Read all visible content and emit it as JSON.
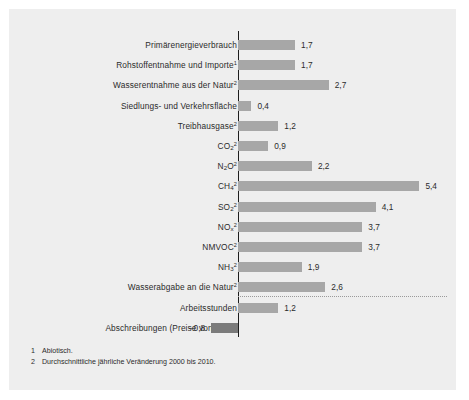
{
  "chart_data": {
    "type": "bar",
    "orientation": "horizontal",
    "title": "",
    "xlabel": "",
    "ylabel": "",
    "grid": false,
    "legend": null,
    "axis_zero": 0,
    "xlim": [
      -1.0,
      6.0
    ],
    "value_decimal_separator": ",",
    "categories": [
      "Primärenergieverbrauch",
      "Rohstoffentnahme und Importe",
      "Wasserentnahme aus der Natur",
      "Siedlungs- und Verkehrsfläche",
      "Treibhausgase",
      "CO2",
      "N2O",
      "CH4",
      "SO2",
      "NOx",
      "NMVOC",
      "NH3",
      "Wasserabgabe an die Natur",
      "Arbeitsstunden",
      "Abschreibungen (Preise von 2000)"
    ],
    "values": [
      1.7,
      1.7,
      2.7,
      0.4,
      1.2,
      0.9,
      2.2,
      5.4,
      4.1,
      3.7,
      3.7,
      1.9,
      2.6,
      1.2,
      -0.8
    ],
    "value_labels": [
      "1,7",
      "1,7",
      "2,7",
      "0,4",
      "1,2",
      "0,9",
      "2,2",
      "5,4",
      "4,1",
      "3,7",
      "3,7",
      "1,9",
      "2,6",
      "1,2",
      "−0,8"
    ]
  },
  "panel": {
    "background_color": "#eeeeee",
    "bar_color_positive": "#a7a7a7",
    "bar_color_negative": "#7b7b7b",
    "axis_color": "#1d1d1d",
    "separator_color": "#9a9a9a"
  },
  "rows": [
    {
      "label_html": "Primärenergieverbrauch",
      "label_main": "Primärenergieverbrauch",
      "label_sub": "",
      "label_sup": "",
      "value": 1.7,
      "value_label": "1,7"
    },
    {
      "label_html": "Rohstoffentnahme und Importe¹",
      "label_main": "Rohstoffentnahme und Importe",
      "label_sub": "",
      "label_sup": "1",
      "value": 1.7,
      "value_label": "1,7"
    },
    {
      "label_html": "Wasserentnahme aus der Natur²",
      "label_main": "Wasserentnahme aus der Natur",
      "label_sub": "",
      "label_sup": "2",
      "value": 2.7,
      "value_label": "2,7"
    },
    {
      "label_html": "Siedlungs- und Verkehrsfläche",
      "label_main": "Siedlungs- und Verkehrsfläche",
      "label_sub": "",
      "label_sup": "",
      "value": 0.4,
      "value_label": "0,4"
    },
    {
      "label_html": "Treibhausgase²",
      "label_main": "Treibhausgase",
      "label_sub": "",
      "label_sup": "2",
      "value": 1.2,
      "value_label": "1,2"
    },
    {
      "label_html": "CO₂²",
      "label_main": "CO",
      "label_sub": "2",
      "label_sup": "2",
      "value": 0.9,
      "value_label": "0,9"
    },
    {
      "label_html": "N₂O²",
      "label_main": "N",
      "label_sub": "2",
      "label_sup": "2",
      "label_tail": "O",
      "value": 2.2,
      "value_label": "2,2"
    },
    {
      "label_html": "CH₄²",
      "label_main": "CH",
      "label_sub": "4",
      "label_sup": "2",
      "value": 5.4,
      "value_label": "5,4"
    },
    {
      "label_html": "SO₂²",
      "label_main": "SO",
      "label_sub": "2",
      "label_sup": "2",
      "value": 4.1,
      "value_label": "4,1"
    },
    {
      "label_html": "NOₓ²",
      "label_main": "NO",
      "label_sub": "x",
      "label_sup": "2",
      "value": 3.7,
      "value_label": "3,7"
    },
    {
      "label_html": "NMVOC²",
      "label_main": "NMVOC",
      "label_sub": "",
      "label_sup": "2",
      "value": 3.7,
      "value_label": "3,7"
    },
    {
      "label_html": "NH₃²",
      "label_main": "NH",
      "label_sub": "3",
      "label_sup": "2",
      "value": 1.9,
      "value_label": "1,9"
    },
    {
      "label_html": "Wasserabgabe an die Natur²",
      "label_main": "Wasserabgabe an die Natur",
      "label_sub": "",
      "label_sup": "2",
      "value": 2.6,
      "value_label": "2,6"
    },
    {
      "label_html": "Arbeitsstunden",
      "label_main": "Arbeitsstunden",
      "label_sub": "",
      "label_sup": "",
      "value": 1.2,
      "value_label": "1,2"
    },
    {
      "label_html": "Abschreibungen (Preise von 2000)",
      "label_main": "Abschreibungen (Preise von 2000)",
      "label_sub": "",
      "label_sup": "",
      "value": -0.8,
      "value_label": "−0,8"
    }
  ],
  "footnotes": [
    {
      "num": "1",
      "text": "Abiotisch."
    },
    {
      "num": "2",
      "text": "Durchschnittliche jährliche Veränderung 2000 bis 2010."
    }
  ]
}
